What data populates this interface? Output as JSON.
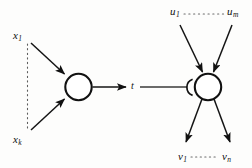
{
  "figure": {
    "kind": "neuron-threshold-diagram",
    "background_color": "#fdfdfc",
    "ink_color": "#0f0f0f"
  },
  "left_unit": {
    "inputs": [
      {
        "base": "x",
        "subscript": "1"
      },
      {
        "base": "x",
        "subscript": "k"
      }
    ],
    "vertical_ellipsis_style": "dotted"
  },
  "connection": {
    "label_base": "t",
    "label_subscript": ""
  },
  "right_unit": {
    "inputs": [
      {
        "base": "u",
        "subscript": "1"
      },
      {
        "base": "u",
        "subscript": "m"
      }
    ],
    "outputs": [
      {
        "base": "v",
        "subscript": "1"
      },
      {
        "base": "v",
        "subscript": "n"
      }
    ],
    "inhibitory_marker": "arc"
  }
}
